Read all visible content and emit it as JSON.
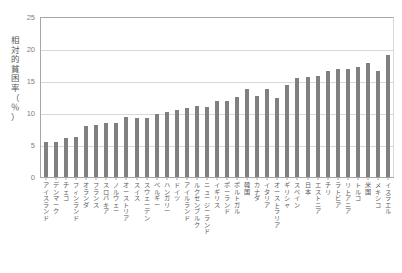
{
  "chart_data": {
    "type": "bar",
    "title": "",
    "subtitle": "",
    "xlabel": "",
    "ylabel": "相対的貧困率（％）",
    "ylabel_chars": "相\n対\n的\n貧\n困\n率\n（\n％\n）",
    "ylim": [
      0,
      25
    ],
    "yticks": [
      0,
      5,
      10,
      15,
      20,
      25
    ],
    "ytick_labels": [
      "0",
      "5",
      "10",
      "15",
      "20",
      "25"
    ],
    "grid": true,
    "grid_axis": "y",
    "legend": false,
    "legend_position": "none",
    "bar_color": "#808080",
    "axis_color": "#a6a6a6",
    "grid_color": "#d9d9d9",
    "text_color": "#595959",
    "categories": [
      "アイスランド",
      "デンマーク",
      "チェコ",
      "フィンランド",
      "オランダ",
      "フランス",
      "スロバキア",
      "ノルウェー",
      "オーストリア",
      "スイス",
      "スウェーデン",
      "ベルギー",
      "ハンガリー",
      "ドイツ",
      "アイルランド",
      "ルクセンブルク",
      "ニュージーランド",
      "イギリス",
      "ポーランド",
      "ポルトガル",
      "韓国",
      "カナダ",
      "イタリア",
      "オーストラリア",
      "ギリシャ",
      "スペイン",
      "日本",
      "エストニア",
      "チリ",
      "ラトビア",
      "リトアニア",
      "トルコ",
      "米国",
      "メキシコ",
      "イスラエル"
    ],
    "values": [
      5.4,
      5.5,
      6.1,
      6.3,
      7.9,
      8.1,
      8.4,
      8.4,
      9.4,
      9.2,
      9.2,
      9.8,
      10.1,
      10.4,
      10.8,
      11.1,
      10.9,
      11.9,
      11.8,
      12.5,
      13.8,
      12.6,
      13.7,
      12.4,
      14.4,
      15.5,
      15.7,
      15.8,
      16.5,
      16.8,
      16.9,
      17.2,
      17.8,
      16.6,
      19.0
    ],
    "series": [
      {
        "name": "相対的貧困率",
        "values": [
          5.4,
          5.5,
          6.1,
          6.3,
          7.9,
          8.1,
          8.4,
          8.4,
          9.4,
          9.2,
          9.2,
          9.8,
          10.1,
          10.4,
          10.8,
          11.1,
          10.9,
          11.9,
          11.8,
          12.5,
          13.8,
          12.6,
          13.7,
          12.4,
          14.4,
          15.5,
          15.7,
          15.8,
          16.5,
          16.8,
          16.9,
          17.2,
          17.8,
          16.6,
          19.0
        ]
      }
    ],
    "annotations": []
  }
}
